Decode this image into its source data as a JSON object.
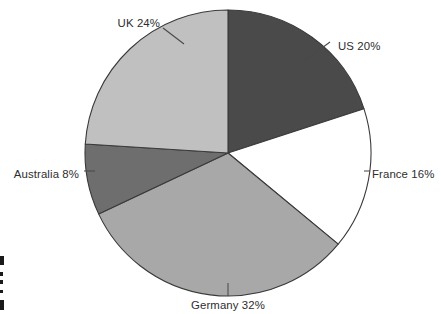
{
  "chart_data": {
    "type": "pie",
    "title": "",
    "subtitle": "",
    "xlabel": "",
    "ylabel": "",
    "unit": "%",
    "legend_position": "none",
    "grid": false,
    "start_angle_deg": 0,
    "direction": "clockwise",
    "categories": [
      "US",
      "France",
      "Germany",
      "Australia",
      "UK"
    ],
    "values": [
      20,
      16,
      32,
      8,
      24
    ],
    "total": 100,
    "labels": [
      "US 20%",
      "France 16%",
      "Germany 32%",
      "Australia 8%",
      "UK 24%"
    ],
    "slices": [
      {
        "name": "US",
        "value": 20,
        "label": "US 20%",
        "color": "#4a4a4a",
        "start_deg": 0,
        "end_deg": 72,
        "label_x": 338,
        "label_y": 47,
        "label_anchor": "start",
        "leader": [
          [
            303,
            62
          ],
          [
            330,
            42
          ]
        ]
      },
      {
        "name": "France",
        "value": 16,
        "label": "France 16%",
        "color": "#ffffff",
        "start_deg": 72,
        "end_deg": 129.6,
        "label_x": 372,
        "label_y": 175,
        "label_anchor": "start",
        "leader": [
          [
            364,
            171
          ],
          [
            370,
            171
          ]
        ]
      },
      {
        "name": "Germany",
        "value": 32,
        "label": "Germany 32%",
        "color": "#a8a8a8",
        "start_deg": 129.6,
        "end_deg": 244.8,
        "label_x": 228,
        "label_y": 306,
        "label_anchor": "middle",
        "leader": [
          [
            228,
            283
          ],
          [
            228,
            296
          ]
        ]
      },
      {
        "name": "Australia",
        "value": 8,
        "label": "Australia 8%",
        "color": "#6e6e6e",
        "start_deg": 244.8,
        "end_deg": 273.6,
        "label_x": 79,
        "label_y": 175,
        "label_anchor": "end",
        "leader": [
          [
            84,
            171
          ],
          [
            95,
            171
          ]
        ]
      },
      {
        "name": "UK",
        "value": 24,
        "label": "UK 24%",
        "color": "#c0c0c0",
        "start_deg": 273.6,
        "end_deg": 360,
        "label_x": 160,
        "label_y": 24,
        "label_anchor": "end",
        "leader": [
          [
            163,
            28
          ],
          [
            184,
            44
          ]
        ]
      }
    ],
    "geometry": {
      "center_x": 228,
      "center_y": 153,
      "radius": 143,
      "outline_color": "#3a3a3a"
    },
    "background_color": "#ffffff",
    "text_color": "#2e2e2e"
  },
  "edge_marks": [
    {
      "x": 0,
      "y": 256,
      "w": 4,
      "h": 9
    },
    {
      "x": 0,
      "y": 272,
      "w": 3,
      "h": 4
    },
    {
      "x": 0,
      "y": 280,
      "w": 3,
      "h": 4
    },
    {
      "x": 0,
      "y": 290,
      "w": 3,
      "h": 3
    },
    {
      "x": 0,
      "y": 300,
      "w": 4,
      "h": 10
    }
  ]
}
